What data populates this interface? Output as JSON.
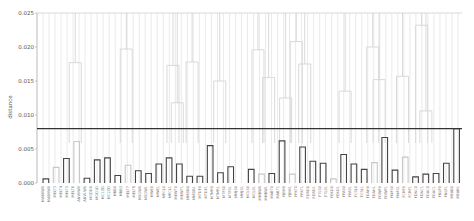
{
  "chart_data": {
    "type": "dendrogram",
    "title": "",
    "xlabel": "",
    "ylabel": "distance",
    "ylim": [
      0,
      0.025
    ],
    "yticks": [
      "0.000",
      "0.005",
      "0.010",
      "0.015",
      "0.020",
      "0.025"
    ],
    "threshold": 0.008,
    "colors": {
      "upper_links": "#cfcfcf",
      "low_clusters": "#444444",
      "light_clusters": "#c8c8c8",
      "threshold_line": "#333333",
      "axis": "#aaaaaa"
    },
    "leaf_labels": [
      "MAB8W0",
      "MAB9W0",
      "MELT3",
      "MELT4",
      "MELT5",
      "MELT6",
      "ANV0W0",
      "ANV1W0",
      "MODD0",
      "MOD1D",
      "MC1ZD",
      "MC2ZD",
      "MBB0",
      "MBB3",
      "MELT7",
      "MELT8",
      "MSGW0",
      "MSGW1",
      "MWE0",
      "MWE1",
      "MPCL0",
      "MPCL1",
      "MEWT0",
      "MEWT1",
      "MMDB0",
      "MMDB1",
      "MTDF0",
      "MTDF1",
      "MTMR0",
      "MTMR1",
      "MTFS0",
      "MTFS1",
      "MMJS0",
      "MMJS1",
      "MCLS0",
      "MCLS1",
      "MMBW0",
      "MMBW1",
      "MABT0",
      "MABT1",
      "FJEM0",
      "FJEM1",
      "FPKT0",
      "FPKT1",
      "FDRD0",
      "FDRD1",
      "FTLS0",
      "FTLS1",
      "FEKD0",
      "FEKD1",
      "FPAS0",
      "FPAS1",
      "FCSL0",
      "FCSL1",
      "FDAH0",
      "FDAH1",
      "FDWP0",
      "FDWP1",
      "FKMS0",
      "FKMS1",
      "FCRP0",
      "FCRP1",
      "FDNC0",
      "FDNC1",
      "FDAC0",
      "FDAC1",
      "FNLP0",
      "FNLP1",
      "MEAB0",
      "MEAB1"
    ],
    "clusters": [
      {
        "pos": 0,
        "height": 0.0006,
        "tone": "dark"
      },
      {
        "pos": 1,
        "height": 0.0023,
        "tone": "light"
      },
      {
        "pos": 2,
        "height": 0.0036,
        "tone": "dark"
      },
      {
        "pos": 3,
        "height": 0.0061,
        "tone": "light"
      },
      {
        "pos": 4,
        "height": 0.0007,
        "tone": "dark"
      },
      {
        "pos": 5,
        "height": 0.0034,
        "tone": "dark"
      },
      {
        "pos": 6,
        "height": 0.0037,
        "tone": "dark"
      },
      {
        "pos": 7,
        "height": 0.0011,
        "tone": "dark"
      },
      {
        "pos": 8,
        "height": 0.0026,
        "tone": "light"
      },
      {
        "pos": 9,
        "height": 0.0018,
        "tone": "dark"
      },
      {
        "pos": 10,
        "height": 0.0014,
        "tone": "dark"
      },
      {
        "pos": 11,
        "height": 0.0028,
        "tone": "dark"
      },
      {
        "pos": 12,
        "height": 0.0037,
        "tone": "dark"
      },
      {
        "pos": 13,
        "height": 0.0028,
        "tone": "dark"
      },
      {
        "pos": 14,
        "height": 0.001,
        "tone": "dark"
      },
      {
        "pos": 15,
        "height": 0.001,
        "tone": "dark"
      },
      {
        "pos": 16,
        "height": 0.0055,
        "tone": "dark"
      },
      {
        "pos": 17,
        "height": 0.0015,
        "tone": "dark"
      },
      {
        "pos": 18,
        "height": 0.0024,
        "tone": "dark"
      },
      {
        "pos": 19,
        "height": 0.0,
        "tone": "none"
      },
      {
        "pos": 20,
        "height": 0.002,
        "tone": "dark"
      },
      {
        "pos": 21,
        "height": 0.0013,
        "tone": "light"
      },
      {
        "pos": 22,
        "height": 0.0014,
        "tone": "dark"
      },
      {
        "pos": 23,
        "height": 0.0062,
        "tone": "dark"
      },
      {
        "pos": 24,
        "height": 0.0013,
        "tone": "light"
      },
      {
        "pos": 25,
        "height": 0.0053,
        "tone": "dark"
      },
      {
        "pos": 26,
        "height": 0.0032,
        "tone": "dark"
      },
      {
        "pos": 27,
        "height": 0.0029,
        "tone": "dark"
      },
      {
        "pos": 28,
        "height": 0.0006,
        "tone": "light"
      },
      {
        "pos": 29,
        "height": 0.0042,
        "tone": "dark"
      },
      {
        "pos": 30,
        "height": 0.0028,
        "tone": "dark"
      },
      {
        "pos": 31,
        "height": 0.002,
        "tone": "dark"
      },
      {
        "pos": 32,
        "height": 0.003,
        "tone": "light"
      },
      {
        "pos": 33,
        "height": 0.0067,
        "tone": "dark"
      },
      {
        "pos": 34,
        "height": 0.0019,
        "tone": "dark"
      },
      {
        "pos": 35,
        "height": 0.0038,
        "tone": "light"
      },
      {
        "pos": 36,
        "height": 0.0009,
        "tone": "dark"
      },
      {
        "pos": 37,
        "height": 0.0013,
        "tone": "dark"
      },
      {
        "pos": 38,
        "height": 0.0014,
        "tone": "dark"
      },
      {
        "pos": 39,
        "height": 0.0029,
        "tone": "dark"
      },
      {
        "pos": 40,
        "height": 0.008,
        "tone": "dark"
      }
    ],
    "upper_merges": [
      {
        "x": 0.09,
        "height": 0.0177
      },
      {
        "x": 0.21,
        "height": 0.0197
      },
      {
        "x": 0.32,
        "height": 0.0173
      },
      {
        "x": 0.33,
        "height": 0.0118
      },
      {
        "x": 0.365,
        "height": 0.0178
      },
      {
        "x": 0.43,
        "height": 0.015
      },
      {
        "x": 0.52,
        "height": 0.0196
      },
      {
        "x": 0.545,
        "height": 0.0155
      },
      {
        "x": 0.585,
        "height": 0.0125
      },
      {
        "x": 0.61,
        "height": 0.0208
      },
      {
        "x": 0.63,
        "height": 0.0175
      },
      {
        "x": 0.725,
        "height": 0.0135
      },
      {
        "x": 0.79,
        "height": 0.02
      },
      {
        "x": 0.805,
        "height": 0.0152
      },
      {
        "x": 0.86,
        "height": 0.0157
      },
      {
        "x": 0.905,
        "height": 0.0232
      },
      {
        "x": 0.915,
        "height": 0.0106
      }
    ]
  }
}
